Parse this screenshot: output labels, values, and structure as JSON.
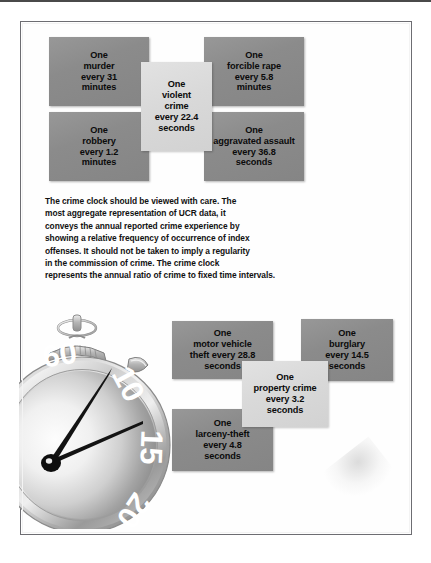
{
  "figure": {
    "title": "The Crime Clock",
    "note_paragraph": "The crime clock should be viewed with care. The\nmost aggregate representation of UCR data, it\nconveys the annual reported crime experience by\nshowing a relative frequency of occurrence of index\noffenses. It should not be taken to imply a regularity\nin the commission of crime. The crime clock\nrepresents the annual ratio of crime to fixed time intervals."
  },
  "colors": {
    "box_dark": "#8b8b8b",
    "box_light": "#d9d9d9",
    "text": "#0b0b0b",
    "frame_border": "#6d6d72",
    "page_background": "#ffffff"
  },
  "violent_crime_group": {
    "center": {
      "label": "One\nviolent\ncrime\nevery 22.4\nseconds",
      "offense": "violent crime",
      "interval": "22.4 seconds",
      "tone": "light"
    },
    "boxes": [
      {
        "label": "One\nmurder\nevery 31\nminutes",
        "offense": "murder",
        "interval": "31 minutes",
        "tone": "dark"
      },
      {
        "label": "One\nforcible rape\nevery 5.8\nminutes",
        "offense": "forcible rape",
        "interval": "5.8 minutes",
        "tone": "dark"
      },
      {
        "label": "One\nrobbery\nevery 1.2\nminutes",
        "offense": "robbery",
        "interval": "1.2 minutes",
        "tone": "dark"
      },
      {
        "label": "One\naggravated assault\nevery 36.8\nseconds",
        "offense": "aggravated assault",
        "interval": "36.8 seconds",
        "tone": "dark"
      }
    ]
  },
  "property_crime_group": {
    "center": {
      "label": "One\nproperty crime\nevery 3.2\nseconds",
      "offense": "property crime",
      "interval": "3.2 seconds",
      "tone": "light"
    },
    "boxes": [
      {
        "label": "One\nmotor vehicle\ntheft every 28.8\nseconds",
        "offense": "motor vehicle theft",
        "interval": "28.8 seconds",
        "tone": "dark"
      },
      {
        "label": "One\nburglary\nevery 14.5\nseconds",
        "offense": "burglary",
        "interval": "14.5 seconds",
        "tone": "dark"
      },
      {
        "label": "One\nlarceny-theft\nevery 4.8\nseconds",
        "offense": "larceny-theft",
        "interval": "4.8 seconds",
        "tone": "dark"
      }
    ]
  },
  "stopwatch": {
    "dial_numerals": [
      "60",
      "10",
      "15",
      "20",
      "30"
    ],
    "hands": 2,
    "features": [
      "bow-ring",
      "ridged-crown",
      "side-button",
      "bezel",
      "dial",
      "minute-hand",
      "second-hand",
      "hub"
    ]
  }
}
